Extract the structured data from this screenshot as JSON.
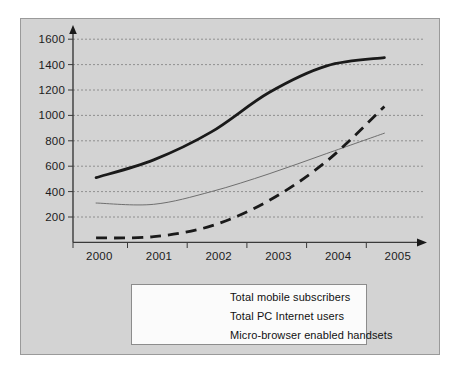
{
  "chart_data": {
    "type": "line",
    "title": "",
    "subtitle": "",
    "xlabel": "",
    "ylabel": "",
    "grid": true,
    "grid_axis": "y",
    "legend_position": "bottom-center",
    "x": [
      2000,
      2001,
      2002,
      2003,
      2004,
      2005
    ],
    "xtick_labels": [
      "2000",
      "2001",
      "2002",
      "2003",
      "2004",
      "2005"
    ],
    "ytick_labels": [
      "200",
      "400",
      "600",
      "800",
      "1000",
      "1200",
      "1400",
      "1600"
    ],
    "yticks": [
      200,
      400,
      600,
      800,
      1000,
      1200,
      1400,
      1600
    ],
    "ylim": [
      0,
      1680
    ],
    "xlim": [
      1999.6,
      2005.6
    ],
    "series": [
      {
        "name": "Total mobile subscribers",
        "style": "solid-thick",
        "color": "#1a1a1a",
        "width": 3,
        "values": [
          510,
          650,
          870,
          1180,
          1390,
          1455
        ]
      },
      {
        "name": "Total PC Internet users",
        "style": "solid-thin",
        "color": "#6f6f6f",
        "width": 1,
        "values": [
          310,
          300,
          400,
          540,
          700,
          860
        ]
      },
      {
        "name": "Micro-browser enabled handsets",
        "style": "dashed-thick",
        "color": "#1a1a1a",
        "width": 3,
        "values": [
          35,
          45,
          130,
          330,
          640,
          1070
        ]
      }
    ]
  },
  "legend": {
    "entries": [
      {
        "label": "Total mobile subscribers"
      },
      {
        "label": "Total PC Internet users"
      },
      {
        "label": "Micro-browser enabled handsets"
      }
    ]
  },
  "colors": {
    "figure_background": "#d3d3d3",
    "figure_border": "#9a9a9a",
    "legend_background": "#fbfbfb",
    "legend_border": "#8c8c8c",
    "axis": "#3a3a3a",
    "gridline": "#7d7d7d",
    "text": "#1c1c1c"
  }
}
